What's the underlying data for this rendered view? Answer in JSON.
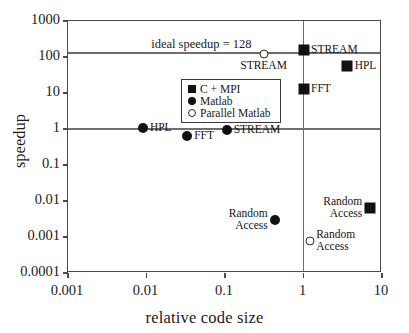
{
  "chart_data": {
    "type": "scatter",
    "title": "",
    "xlabel": "relative code size",
    "ylabel": "speedup",
    "xscale": "log",
    "yscale": "log",
    "xlim": [
      0.001,
      10
    ],
    "ylim": [
      0.0001,
      1000
    ],
    "xticks": [
      "0.001",
      "0.01",
      "0.1",
      "1",
      "10"
    ],
    "xtick_values": [
      0.001,
      0.01,
      0.1,
      1,
      10
    ],
    "yticks": [
      "1000",
      "100",
      "10",
      "1",
      "0.1",
      "0.01",
      "0.001",
      "0.0001"
    ],
    "ytick_values": [
      1000,
      100,
      10,
      1,
      0.1,
      0.01,
      0.001,
      0.0001
    ],
    "grid": false,
    "legend_position": "upper-left-inset",
    "legend": [
      {
        "label": "C + MPI",
        "marker": "filled-square"
      },
      {
        "label": "Matlab",
        "marker": "filled-circle"
      },
      {
        "label": "Parallel Matlab",
        "marker": "open-circle"
      }
    ],
    "annotations": [
      {
        "name": "ideal-speedup-line",
        "text": "ideal speedup = 128",
        "type": "hline",
        "y": 128
      },
      {
        "name": "unity-speedup-line",
        "text": "",
        "type": "hline",
        "y": 1
      },
      {
        "name": "unity-codesize-line",
        "text": "",
        "type": "vline",
        "x": 1
      }
    ],
    "series": [
      {
        "name": "C + MPI",
        "marker": "filled-square",
        "points": [
          {
            "label": "STREAM",
            "x": 1.0,
            "y": 160,
            "label_side": "right"
          },
          {
            "label": "HPL",
            "x": 3.6,
            "y": 55,
            "label_side": "right"
          },
          {
            "label": "FFT",
            "x": 1.0,
            "y": 13,
            "label_side": "right"
          },
          {
            "label": "Random\nAccess",
            "x": 7.0,
            "y": 0.0062,
            "label_side": "left"
          }
        ]
      },
      {
        "name": "Matlab",
        "marker": "filled-circle",
        "points": [
          {
            "label": "HPL",
            "x": 0.009,
            "y": 1.05,
            "label_side": "right"
          },
          {
            "label": "FFT",
            "x": 0.033,
            "y": 0.62,
            "label_side": "right"
          },
          {
            "label": "STREAM",
            "x": 0.105,
            "y": 0.95,
            "label_side": "right"
          },
          {
            "label": "Random\nAccess",
            "x": 0.43,
            "y": 0.003,
            "label_side": "left"
          }
        ]
      },
      {
        "name": "Parallel Matlab",
        "marker": "open-circle",
        "points": [
          {
            "label": "STREAM",
            "x": 0.31,
            "y": 125,
            "label_side": "below"
          },
          {
            "label": "FFT",
            "x": 0.105,
            "y": 13,
            "label_side": "right"
          },
          {
            "label": "HPL(32)",
            "x": 0.11,
            "y": 2.6,
            "label_side": "right"
          },
          {
            "label": "Random\nAccess",
            "x": 1.2,
            "y": 0.00075,
            "label_side": "right"
          }
        ]
      }
    ]
  }
}
